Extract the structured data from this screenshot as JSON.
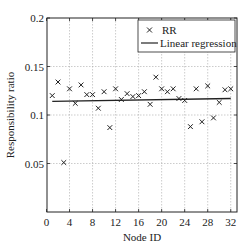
{
  "chart_data": {
    "type": "scatter",
    "title": "",
    "xlabel": "Node ID",
    "ylabel": "Responsibility ratio",
    "xlim": [
      0,
      33
    ],
    "ylim": [
      0,
      0.2
    ],
    "xticks": [
      0,
      4,
      8,
      12,
      16,
      20,
      24,
      28,
      32
    ],
    "yticks": [
      0.05,
      0.1,
      0.15,
      0.2
    ],
    "ytick_labels": [
      "0.05",
      "0.1",
      "0.15",
      "0.2"
    ],
    "grid": true,
    "legend_position": "upper right",
    "series": [
      {
        "name": "RR",
        "marker": "x",
        "x": [
          1,
          2,
          3,
          4,
          5,
          6,
          7,
          8,
          9,
          10,
          11,
          12,
          13,
          14,
          15,
          16,
          17,
          18,
          19,
          20,
          21,
          22,
          23,
          24,
          25,
          26,
          27,
          28,
          29,
          30,
          31,
          32
        ],
        "values": [
          0.12,
          0.134,
          0.051,
          0.127,
          0.112,
          0.131,
          0.121,
          0.121,
          0.107,
          0.124,
          0.087,
          0.127,
          0.116,
          0.122,
          0.119,
          0.12,
          0.124,
          0.111,
          0.139,
          0.127,
          0.124,
          0.127,
          0.117,
          0.115,
          0.088,
          0.127,
          0.093,
          0.13,
          0.097,
          0.113,
          0.126,
          0.127
        ]
      },
      {
        "name": "Linear regression",
        "type": "line",
        "x": [
          1,
          32
        ],
        "values": [
          0.114,
          0.117
        ]
      }
    ]
  },
  "legend": {
    "items": [
      "RR",
      "Linear regression"
    ]
  },
  "axes": {
    "xlabel": "Node ID",
    "ylabel": "Responsibility ratio"
  }
}
